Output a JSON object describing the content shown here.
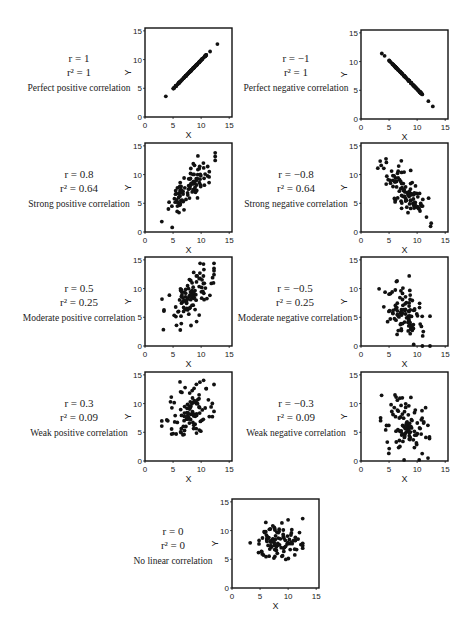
{
  "figure": {
    "axis": {
      "xlabel": "X",
      "ylabel": "Y",
      "ticks": [
        "0",
        "5",
        "10",
        "15"
      ],
      "xlim": [
        0,
        15.5
      ],
      "ylim": [
        0,
        15.5
      ]
    }
  },
  "panels": [
    {
      "id": "perfect-positive",
      "r_text": "r = 1",
      "r2_text": "r² = 1",
      "description": "Perfect positive correlation"
    },
    {
      "id": "perfect-negative",
      "r_text": "r = −1",
      "r2_text": "r² = 1",
      "description": "Perfect negative correlation"
    },
    {
      "id": "strong-positive",
      "r_text": "r = 0.8",
      "r2_text": "r² = 0.64",
      "description": "Strong positive correlation"
    },
    {
      "id": "strong-negative",
      "r_text": "r = −0.8",
      "r2_text": "r² = 0.64",
      "description": "Strong negative correlation"
    },
    {
      "id": "moderate-positive",
      "r_text": "r = 0.5",
      "r2_text": "r² = 0.25",
      "description": "Moderate positive correlation"
    },
    {
      "id": "moderate-negative",
      "r_text": "r = −0.5",
      "r2_text": "r² = 0.25",
      "description": "Moderate negative correlation"
    },
    {
      "id": "weak-positive",
      "r_text": "r = 0.3",
      "r2_text": "r² = 0.09",
      "description": "Weak positive correlation"
    },
    {
      "id": "weak-negative",
      "r_text": "r = −0.3",
      "r2_text": "r² = 0.09",
      "description": "Weak negative correlation"
    },
    {
      "id": "no-correlation",
      "r_text": "r = 0",
      "r2_text": "r² = 0",
      "description": "No linear correlation"
    }
  ],
  "chart_data": [
    {
      "type": "scatter",
      "title": "Perfect positive correlation",
      "r": 1,
      "r2": 1,
      "xlabel": "X",
      "ylabel": "Y",
      "xlim": [
        0,
        15
      ],
      "ylim": [
        0,
        15
      ],
      "x_ticks": [
        0,
        5,
        10,
        15
      ],
      "y_ticks": [
        0,
        5,
        10,
        15
      ],
      "grid": false,
      "n_points": 100,
      "x_range": [
        3.7,
        12.9
      ],
      "y_range": [
        3.6,
        12.7
      ],
      "note": "points on line y≈x; dense from 5 to 11, outliers at (3.7,3.6),(11.6,11.4),(12.9,12.7)"
    },
    {
      "type": "scatter",
      "title": "Perfect negative correlation",
      "r": -1,
      "r2": 1,
      "xlabel": "X",
      "ylabel": "Y",
      "xlim": [
        0,
        15
      ],
      "ylim": [
        0,
        15
      ],
      "x_ticks": [
        0,
        5,
        10,
        15
      ],
      "y_ticks": [
        0,
        5,
        10,
        15
      ],
      "grid": false,
      "n_points": 100,
      "x_range": [
        3.7,
        12.8
      ],
      "y_range": [
        2.2,
        11.4
      ],
      "note": "points on line y≈15.2−x"
    },
    {
      "type": "scatter",
      "title": "Strong positive correlation",
      "r": 0.8,
      "r2": 0.64,
      "xlabel": "X",
      "ylabel": "Y",
      "xlim": [
        0,
        15
      ],
      "ylim": [
        0,
        15
      ],
      "x_ticks": [
        0,
        5,
        10,
        15
      ],
      "y_ticks": [
        0,
        5,
        10,
        15
      ],
      "grid": false,
      "n_points": 100,
      "x_range": [
        3,
        12.5
      ],
      "y_range": [
        0.8,
        13.8
      ],
      "center": [
        8,
        8
      ]
    },
    {
      "type": "scatter",
      "title": "Strong negative correlation",
      "r": -0.8,
      "r2": 0.64,
      "xlabel": "X",
      "ylabel": "Y",
      "xlim": [
        0,
        15
      ],
      "ylim": [
        0,
        15
      ],
      "x_ticks": [
        0,
        5,
        10,
        15
      ],
      "y_ticks": [
        0,
        5,
        10,
        15
      ],
      "grid": false,
      "n_points": 100,
      "x_range": [
        3,
        12.5
      ],
      "y_range": [
        1,
        14.2
      ],
      "center": [
        8,
        7
      ]
    },
    {
      "type": "scatter",
      "title": "Moderate positive correlation",
      "r": 0.5,
      "r2": 0.25,
      "xlabel": "X",
      "ylabel": "Y",
      "xlim": [
        0,
        15
      ],
      "ylim": [
        0,
        15
      ],
      "x_ticks": [
        0,
        5,
        10,
        15
      ],
      "y_ticks": [
        0,
        5,
        10,
        15
      ],
      "grid": false,
      "n_points": 100,
      "x_range": [
        3,
        12.3
      ],
      "y_range": [
        1.3,
        14.4
      ],
      "center": [
        8,
        8.5
      ]
    },
    {
      "type": "scatter",
      "title": "Moderate negative correlation",
      "r": -0.5,
      "r2": 0.25,
      "xlabel": "X",
      "ylabel": "Y",
      "xlim": [
        0,
        15
      ],
      "ylim": [
        0,
        15
      ],
      "x_ticks": [
        0,
        5,
        10,
        15
      ],
      "y_ticks": [
        0,
        5,
        10,
        15
      ],
      "grid": false,
      "n_points": 100,
      "x_range": [
        3,
        12.3
      ],
      "y_range": [
        0,
        14.2
      ],
      "center": [
        8,
        6
      ]
    },
    {
      "type": "scatter",
      "title": "Weak positive correlation",
      "r": 0.3,
      "r2": 0.09,
      "xlabel": "X",
      "ylabel": "Y",
      "xlim": [
        0,
        15
      ],
      "ylim": [
        0,
        15
      ],
      "x_ticks": [
        0,
        5,
        10,
        15
      ],
      "y_ticks": [
        0,
        5,
        10,
        15
      ],
      "grid": false,
      "n_points": 100,
      "x_range": [
        3,
        12.3
      ],
      "y_range": [
        0.7,
        14.8
      ],
      "center": [
        8,
        8.5
      ]
    },
    {
      "type": "scatter",
      "title": "Weak negative correlation",
      "r": -0.3,
      "r2": 0.09,
      "xlabel": "X",
      "ylabel": "Y",
      "xlim": [
        0,
        15
      ],
      "ylim": [
        0,
        15
      ],
      "x_ticks": [
        0,
        5,
        10,
        15
      ],
      "y_ticks": [
        0,
        5,
        10,
        15
      ],
      "grid": false,
      "n_points": 100,
      "x_range": [
        3.5,
        12.2
      ],
      "y_range": [
        0.2,
        14.5
      ],
      "center": [
        8,
        6
      ]
    },
    {
      "type": "scatter",
      "title": "No linear correlation",
      "r": 0,
      "r2": 0,
      "xlabel": "X",
      "ylabel": "Y",
      "xlim": [
        0,
        15
      ],
      "ylim": [
        0,
        15
      ],
      "x_ticks": [
        0,
        5,
        10,
        15
      ],
      "y_ticks": [
        0,
        5,
        10,
        15
      ],
      "grid": false,
      "n_points": 100,
      "x_range": [
        2.8,
        12.6
      ],
      "y_range": [
        3.5,
        12.8
      ],
      "center": [
        8.5,
        8
      ]
    }
  ]
}
